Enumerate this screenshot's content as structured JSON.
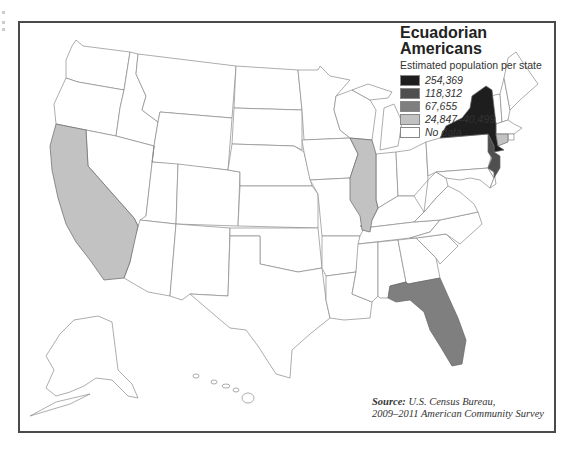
{
  "map": {
    "title_line1": "Ecuadorian",
    "title_line2": "Americans",
    "subtitle": "Estimated population per state",
    "legend": [
      {
        "label": "254,369",
        "color": "#1e1e1e"
      },
      {
        "label": "118,312",
        "color": "#4f4f4f"
      },
      {
        "label": "67,655",
        "color": "#7f7f7f"
      },
      {
        "label": "24,847–40,499",
        "color": "#c2c2c2"
      },
      {
        "label": "No data",
        "color": "#ffffff"
      }
    ],
    "source_label": "Source:",
    "source_line1": "U.S. Census Bureau,",
    "source_line2": "2009–2011 American Community Survey",
    "highlighted_states": [
      {
        "state": "New York",
        "value": "254,369",
        "color": "#1e1e1e"
      },
      {
        "state": "New Jersey",
        "value": "118,312",
        "color": "#4f4f4f"
      },
      {
        "state": "Florida",
        "value": "67,655",
        "color": "#7f7f7f"
      },
      {
        "state": "California",
        "value": "24,847–40,499",
        "color": "#c2c2c2"
      },
      {
        "state": "Illinois",
        "value": "24,847–40,499",
        "color": "#c2c2c2"
      },
      {
        "state": "Connecticut",
        "value": "24,847–40,499",
        "color": "#c2c2c2"
      }
    ]
  }
}
